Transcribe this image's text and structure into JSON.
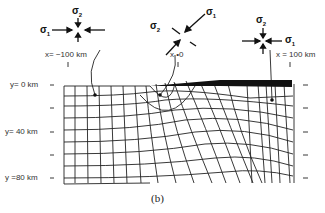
{
  "figure": {
    "caption": "(b)",
    "x_labels": [
      {
        "text": "x= −100 km",
        "x": 45,
        "y": 53
      },
      {
        "text": "x •0",
        "x": 173,
        "y": 53
      },
      {
        "text": "x = 100 km",
        "x": 276,
        "y": 53
      }
    ],
    "y_labels": [
      {
        "text": "y= 0 km",
        "y": 85
      },
      {
        "text": "y= 40 km",
        "y": 132
      },
      {
        "text": "y =80 km",
        "y": 178
      }
    ],
    "stress_symbols": [
      {
        "position": "x = -100 km",
        "sigma1": "σ",
        "sigma1_sub": "1",
        "sigma2": "σ",
        "sigma2_sub": "2",
        "orientation": "horizontal sigma1"
      },
      {
        "position": "x = 0",
        "sigma1": "σ",
        "sigma1_sub": "1",
        "sigma2": "σ",
        "sigma2_sub": "2",
        "orientation": "rotated ~45 deg"
      },
      {
        "position": "x = 100 km",
        "sigma1": "σ",
        "sigma1_sub": "1",
        "sigma2": "σ",
        "sigma2_sub": "2",
        "orientation": "horizontal sigma1"
      }
    ],
    "surface_load": "black tapered bar from x=0 to x=100 km",
    "grid": "deformed stress-trajectory mesh"
  }
}
